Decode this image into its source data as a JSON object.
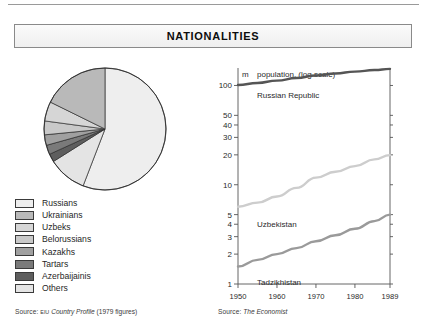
{
  "page": {
    "title": "NATIONALITIES"
  },
  "pie_panel": {
    "source_prefix": "Source:",
    "source_small": "EIU",
    "source_italic": "Country Profile",
    "source_suffix": "(1979 figures)",
    "legend": [
      {
        "label": "Russians",
        "color": "#eeeeee"
      },
      {
        "label": "Ukrainians",
        "color": "#b9b9b9"
      },
      {
        "label": "Uzbeks",
        "color": "#d6d6d6"
      },
      {
        "label": "Belorussians",
        "color": "#c9c9c9"
      },
      {
        "label": "Kazakhs",
        "color": "#a0a0a0"
      },
      {
        "label": "Tartars",
        "color": "#7a7a7a"
      },
      {
        "label": "Azerbaijainis",
        "color": "#5e5e5e"
      },
      {
        "label": "Others",
        "color": "#e4e4e4"
      }
    ]
  },
  "chart_data": {
    "type": "line",
    "title": "population, (log scale)",
    "unit_label": "m",
    "xlabel": "",
    "ylabel": "population, (log scale)",
    "log_scale": true,
    "ylim": [
      1,
      150
    ],
    "xlim": [
      1950,
      1989
    ],
    "grid": false,
    "legend_position": "inline-annotation",
    "ytick_labels": [
      "100",
      "50",
      "40",
      "30",
      "20",
      "10",
      "5",
      "4",
      "3",
      "2",
      "1"
    ],
    "ytick_values": [
      100,
      50,
      40,
      30,
      20,
      10,
      5,
      4,
      3,
      2,
      1
    ],
    "xtick_labels": [
      "1950",
      "1960",
      "1970",
      "1980",
      "1989"
    ],
    "xtick_values": [
      1950,
      1960,
      1970,
      1980,
      1989
    ],
    "x": [
      1950,
      1955,
      1960,
      1965,
      1970,
      1975,
      1980,
      1985,
      1989
    ],
    "series": [
      {
        "name": "Russian Republic",
        "color": "#555555",
        "values": [
          101,
          106,
          112,
          119,
          126,
          132,
          138,
          143,
          147
        ]
      },
      {
        "name": "Uzbekistan",
        "color": "#cdcdcd",
        "values": [
          6.0,
          6.6,
          7.6,
          9.3,
          11.8,
          13.5,
          15.4,
          18.0,
          19.9
        ]
      },
      {
        "name": "Tadzikhistan",
        "color": "#9a9a9a",
        "values": [
          1.5,
          1.75,
          2.0,
          2.3,
          2.7,
          3.1,
          3.6,
          4.3,
          5.0
        ]
      }
    ],
    "annotations": [
      {
        "text": "Russian Republic",
        "series": "Russian Republic"
      },
      {
        "text": "Uzbekistan",
        "series": "Uzbekistan"
      },
      {
        "text": "Tadzikhistan",
        "series": "Tadzikhistan"
      }
    ],
    "source_prefix": "Source:",
    "source_italic": "The Economist"
  },
  "pie_data": {
    "type": "pie",
    "slices": [
      {
        "label": "Russians",
        "value": 52.0,
        "color": "#eeeeee"
      },
      {
        "label": "Others",
        "value": 9.5,
        "color": "#e4e4e4"
      },
      {
        "label": "Azerbaijainis",
        "value": 2.0,
        "color": "#5e5e5e"
      },
      {
        "label": "Tartars",
        "value": 2.3,
        "color": "#7a7a7a"
      },
      {
        "label": "Kazakhs",
        "value": 2.6,
        "color": "#a0a0a0"
      },
      {
        "label": "Belorussians",
        "value": 3.4,
        "color": "#c9c9c9"
      },
      {
        "label": "Uzbeks",
        "value": 4.8,
        "color": "#d6d6d6"
      },
      {
        "label": "Ukrainians",
        "value": 16.5,
        "color": "#b9b9b9"
      }
    ]
  }
}
